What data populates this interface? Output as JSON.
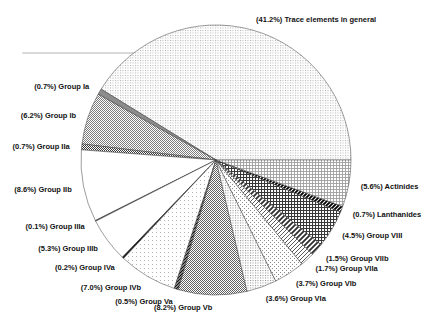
{
  "chart_data": {
    "type": "pie",
    "title": "",
    "unit": "%",
    "start_angle_deg": 0,
    "direction": "counterclockwise",
    "label_format": "({value}%) {name}",
    "legend": "none",
    "colors": {
      "background": "#ffffff",
      "outline": "#3a3a3a",
      "label_text": "#111111"
    },
    "slices": [
      {
        "name": "Trace elements in general",
        "value": 41.2,
        "pattern": "dots-fine-light"
      },
      {
        "name": "Group Ia",
        "value": 0.7,
        "pattern": "solid-dark-gray"
      },
      {
        "name": "Group Ib",
        "value": 6.2,
        "pattern": "checker-medium"
      },
      {
        "name": "Group IIa",
        "value": 0.7,
        "pattern": "checker-dark"
      },
      {
        "name": "Group IIb",
        "value": 8.6,
        "pattern": "white"
      },
      {
        "name": "Group IIIa",
        "value": 0.1,
        "pattern": "dark-line"
      },
      {
        "name": "Group IIIb",
        "value": 5.3,
        "pattern": "white"
      },
      {
        "name": "Group IVa",
        "value": 0.2,
        "pattern": "black-line"
      },
      {
        "name": "Group IVb",
        "value": 7.0,
        "pattern": "dots-very-light"
      },
      {
        "name": "Group Va",
        "value": 0.5,
        "pattern": "hatch-dark"
      },
      {
        "name": "Group Vb",
        "value": 8.2,
        "pattern": "checker-medium-dark"
      },
      {
        "name": "Group VIa",
        "value": 3.6,
        "pattern": "dots-light"
      },
      {
        "name": "Group VIb",
        "value": 3.7,
        "pattern": "dots-diagonal-light"
      },
      {
        "name": "Group VIIa",
        "value": 1.7,
        "pattern": "stripes-thin"
      },
      {
        "name": "Group VIIb",
        "value": 1.5,
        "pattern": "stripes-bold"
      },
      {
        "name": "Group VIII",
        "value": 4.5,
        "pattern": "crosshatch-dark"
      },
      {
        "name": "Lanthanides",
        "value": 0.7,
        "pattern": "stripes-black"
      },
      {
        "name": "Actinides",
        "value": 5.6,
        "pattern": "grid-fine"
      }
    ]
  }
}
